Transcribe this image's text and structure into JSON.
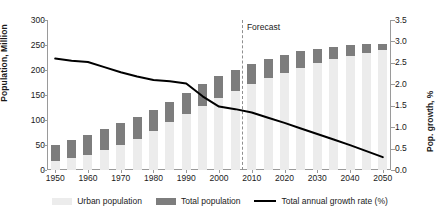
{
  "chart_data": {
    "type": "bar",
    "title": "",
    "subtitle": "",
    "xlabel": "",
    "ylabel": "Population, Million",
    "y2label": "Pop. growth, %",
    "ylim": [
      0,
      300
    ],
    "y2lim": [
      0,
      3.5
    ],
    "grid": false,
    "legend_position": "bottom-center",
    "x": [
      1950,
      1955,
      1960,
      1965,
      1970,
      1975,
      1980,
      1985,
      1990,
      1995,
      2000,
      2005,
      2010,
      2015,
      2020,
      2025,
      2030,
      2035,
      2040,
      2045,
      2050
    ],
    "xtick_labels": [
      "1950",
      "1960",
      "1970",
      "1980",
      "1990",
      "2000",
      "2010",
      "2020",
      "2030",
      "2040",
      "2050"
    ],
    "xticks": [
      1950,
      1960,
      1970,
      1980,
      1990,
      2000,
      2010,
      2020,
      2030,
      2040,
      2050
    ],
    "ytick_labels": [
      "0",
      "50",
      "100",
      "150",
      "200",
      "250",
      "300"
    ],
    "yticks": [
      0,
      50,
      100,
      150,
      200,
      250,
      300
    ],
    "y2tick_labels": [
      "0.0",
      "0.5",
      "1.0",
      "1.5",
      "2.0",
      "2.5",
      "3.0",
      "3.5"
    ],
    "y2ticks": [
      0.0,
      0.5,
      1.0,
      1.5,
      2.0,
      2.5,
      3.0,
      3.5
    ],
    "annotations": [
      {
        "text": "Forecast",
        "x": 2007,
        "kind": "forecast-divider"
      }
    ],
    "series": [
      {
        "name": "Total population",
        "type": "bar",
        "axis": "left",
        "color": "#7d7d7d",
        "values": [
          50,
          60,
          70,
          82,
          94,
          106,
          120,
          137,
          155,
          172,
          188,
          200,
          212,
          222,
          231,
          238,
          243,
          247,
          250,
          252,
          253
        ]
      },
      {
        "name": "Urban population",
        "type": "bar",
        "axis": "left",
        "color": "#ececec",
        "values": [
          18,
          24,
          31,
          40,
          51,
          63,
          79,
          96,
          112,
          128,
          144,
          158,
          172,
          184,
          195,
          205,
          214,
          222,
          229,
          235,
          240
        ]
      },
      {
        "name": "Total annual growth rate (%)",
        "type": "line",
        "axis": "right",
        "color": "#000000",
        "values": [
          2.6,
          2.55,
          2.52,
          2.4,
          2.28,
          2.18,
          2.1,
          2.07,
          2.02,
          1.72,
          1.48,
          1.42,
          1.34,
          1.22,
          1.1,
          0.97,
          0.84,
          0.71,
          0.58,
          0.44,
          0.3
        ]
      }
    ]
  },
  "legend": {
    "items": [
      {
        "label": "Urban population",
        "swatch": "urban-swatch"
      },
      {
        "label": "Total population",
        "swatch": "total-swatch"
      },
      {
        "label": "Total annual growth rate (%)",
        "swatch": "line-swatch"
      }
    ]
  }
}
